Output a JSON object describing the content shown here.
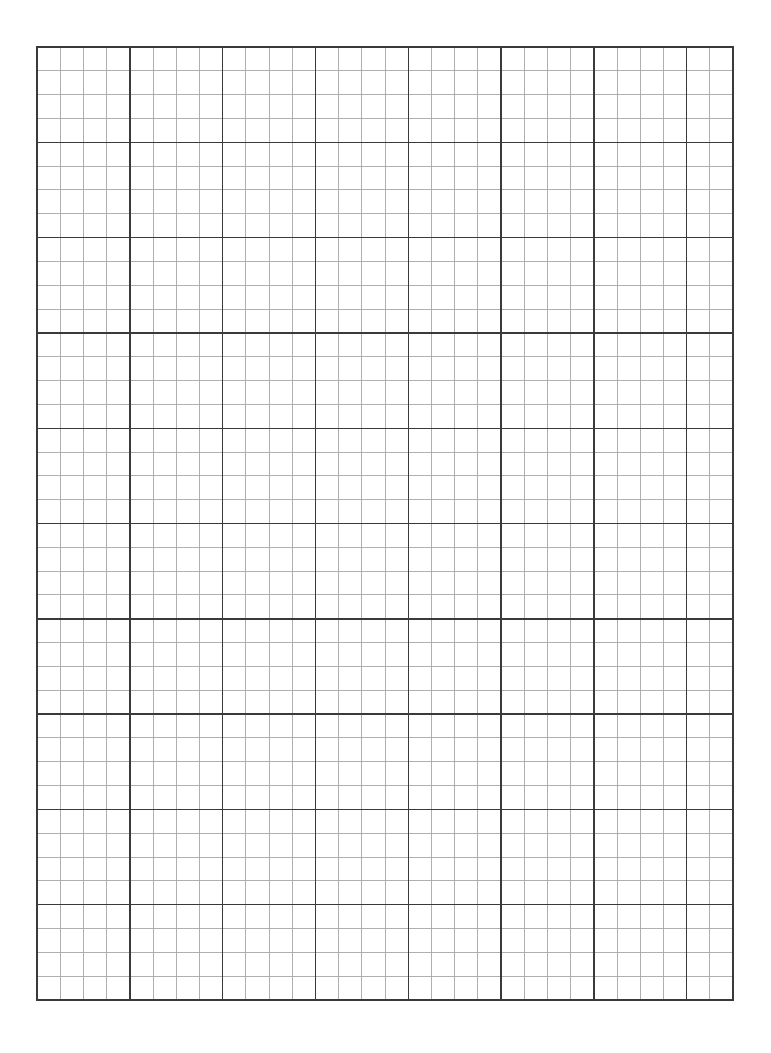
{
  "page": {
    "type": "graph-paper",
    "background_color": "#ffffff",
    "width": 771,
    "height": 1053
  },
  "grid": {
    "left": 37,
    "top": 47,
    "right": 733,
    "bottom": 1000,
    "columns": 30,
    "rows": 40,
    "major_every_columns": 4,
    "major_every_rows": 4,
    "minor_line_color": "#a6a6a6",
    "major_line_color": "#3a3a3a",
    "border_color": "#3a3a3a",
    "minor_line_width": 0.9,
    "major_line_width": 1.4,
    "border_width": 1.4
  }
}
